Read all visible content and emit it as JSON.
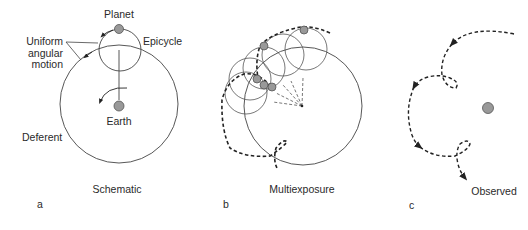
{
  "panels": [
    {
      "id": "a",
      "letter": "a",
      "caption": "Schematic",
      "labels": {
        "planet": "Planet",
        "epicycle": "Epicycle",
        "uniform_1": "Uniform",
        "uniform_2": "angular",
        "uniform_3": "motion",
        "earth": "Earth",
        "deferent": "Deferent"
      }
    },
    {
      "id": "b",
      "letter": "b",
      "caption": "Multiexposure"
    },
    {
      "id": "c",
      "letter": "c",
      "caption": "Observed"
    }
  ],
  "colors": {
    "line": "#444444",
    "body_fill": "#999999",
    "body_stroke": "#555555",
    "text": "#2a2a2a"
  }
}
